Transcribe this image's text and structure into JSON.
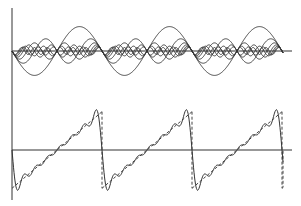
{
  "chart_data": [
    {
      "type": "line",
      "title": "",
      "xlabel": "",
      "ylabel": "",
      "description": "Harmonic components (sine terms) of a sawtooth wave's Fourier series, drawn on a common axis",
      "grid": false,
      "legend": null,
      "periods_shown": 3.1,
      "x_range_radians": [
        0,
        19.5
      ],
      "series": [
        {
          "name": "harmonic 1",
          "n": 1,
          "coefficient": -2.0
        },
        {
          "name": "harmonic 2",
          "n": 2,
          "coefficient": -1.0
        },
        {
          "name": "harmonic 3",
          "n": 3,
          "coefficient": -0.667
        },
        {
          "name": "harmonic 4",
          "n": 4,
          "coefficient": -0.5
        },
        {
          "name": "harmonic 5",
          "n": 5,
          "coefficient": -0.4
        },
        {
          "name": "harmonic 6",
          "n": 6,
          "coefficient": -0.333
        },
        {
          "name": "harmonic 7",
          "n": 7,
          "coefficient": -0.286
        }
      ],
      "ylim": [
        -2.1,
        2.1
      ]
    },
    {
      "type": "line",
      "title": "",
      "xlabel": "",
      "ylabel": "",
      "description": "Partial Fourier sum (solid) approximating an ideal sawtooth wave (dashed)",
      "grid": false,
      "legend": null,
      "series": [
        {
          "name": "partial sum (7 harmonics)",
          "style": "solid",
          "formula": "sum_{n=1..7} -2 sin(n x)/n"
        },
        {
          "name": "sawtooth",
          "style": "dashed",
          "formula": "x - pi (mod 2pi)"
        }
      ],
      "ylim": [
        -3.7,
        3.7
      ]
    }
  ],
  "layout": {
    "axis_x0": 12,
    "axis_x1": 292,
    "vertical_axis_top": 8,
    "vertical_axis_bottom": 200,
    "top_panel_baseline_y": 51,
    "bottom_panel_baseline_y": 150,
    "period_px": 90,
    "top_scale_px_per_unit": 12.2,
    "bottom_scale_px_per_unit": 12.2,
    "harmonics": 7,
    "line_color": "#333333",
    "dashed_end_x": 283
  }
}
